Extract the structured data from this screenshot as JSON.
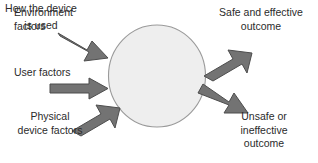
{
  "diagram": {
    "type": "influence-outcome-diagram",
    "center": {
      "shape": "circle",
      "text": "How the\ndevice is\nused",
      "fill": "#eeeeee",
      "stroke": "#9a9a9a"
    },
    "inputs": [
      {
        "id": "environment",
        "label": "Environment\nfactors",
        "arrow_direction": "down-right"
      },
      {
        "id": "user",
        "label": "User factors",
        "arrow_direction": "right"
      },
      {
        "id": "physical-device",
        "label": "Physical\ndevice factors",
        "arrow_direction": "up-right"
      }
    ],
    "outputs": [
      {
        "id": "safe",
        "label": "Safe and effective\noutcome",
        "arrow_direction": "up-right"
      },
      {
        "id": "unsafe",
        "label": "Unsafe or\nineffective\noutcome",
        "arrow_direction": "down-right"
      }
    ],
    "colors": {
      "arrow_fill": "#737373",
      "arrow_stroke": "#4d4d4d",
      "text": "#2b2b2b",
      "background": "#ffffff"
    }
  }
}
